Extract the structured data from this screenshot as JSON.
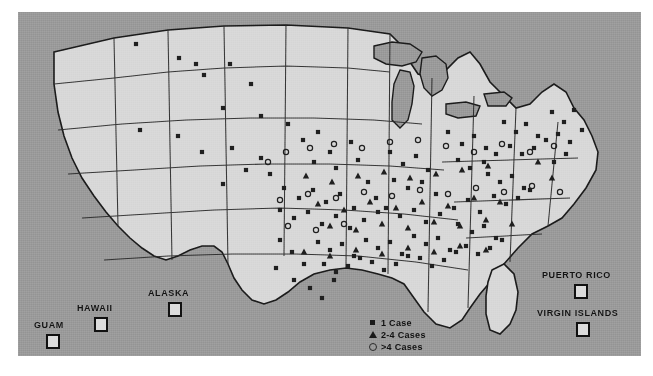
{
  "figure": {
    "background_color": "#ffffff"
  },
  "map": {
    "ocean_color": "#9a9a9a",
    "land_color": "#d8d8d8",
    "border_color": "#1b1b1b",
    "dot_color": "#1f1f1f",
    "frame": {
      "x": 18,
      "y": 12,
      "width": 623,
      "height": 344
    }
  },
  "insets": [
    {
      "name": "guam",
      "label": "GUAM",
      "label_x": 16,
      "label_y": 308,
      "box_x": 28,
      "box_y": 322
    },
    {
      "name": "hawaii",
      "label": "HAWAII",
      "label_x": 59,
      "label_y": 291,
      "box_x": 76,
      "box_y": 305
    },
    {
      "name": "alaska",
      "label": "ALASKA",
      "label_x": 130,
      "label_y": 276,
      "box_x": 150,
      "box_y": 290
    },
    {
      "name": "puerto-rico",
      "label": "PUERTO RICO",
      "label_x": 524,
      "label_y": 258,
      "box_x": 556,
      "box_y": 272
    },
    {
      "name": "virgin-islands",
      "label": "VIRGIN ISLANDS",
      "label_x": 519,
      "label_y": 296,
      "box_x": 558,
      "box_y": 310
    }
  ],
  "legend": {
    "title": "",
    "items": [
      {
        "marker": "square-icon",
        "label": "1 Case"
      },
      {
        "marker": "triangle-icon",
        "label": "2-4 Cases"
      },
      {
        "marker": "circle-icon",
        "label": ">4 Cases"
      }
    ]
  },
  "chart_data": {
    "type": "scatter",
    "xlabel": "",
    "ylabel": "",
    "projection": "US albers-like outline (pixel coordinates within map frame)",
    "grid": false,
    "legend_position": "bottom-center",
    "categories": [
      "1 Case",
      "2-4 Cases",
      ">4 Cases"
    ],
    "marker_shapes": {
      "1 Case": "square",
      "2-4 Cases": "triangle",
      ">4 Cases": "circle"
    },
    "series": [
      {
        "name": "1 Case",
        "symbol": "square",
        "count": 128,
        "points": [
          [
            118,
            32
          ],
          [
            161,
            46
          ],
          [
            178,
            52
          ],
          [
            186,
            63
          ],
          [
            212,
            52
          ],
          [
            233,
            72
          ],
          [
            205,
            96
          ],
          [
            243,
            104
          ],
          [
            122,
            118
          ],
          [
            160,
            124
          ],
          [
            184,
            140
          ],
          [
            214,
            136
          ],
          [
            243,
            146
          ],
          [
            228,
            158
          ],
          [
            252,
            162
          ],
          [
            205,
            172
          ],
          [
            270,
            112
          ],
          [
            285,
            128
          ],
          [
            300,
            120
          ],
          [
            312,
            140
          ],
          [
            296,
            150
          ],
          [
            318,
            156
          ],
          [
            333,
            130
          ],
          [
            340,
            148
          ],
          [
            266,
            176
          ],
          [
            281,
            186
          ],
          [
            295,
            178
          ],
          [
            308,
            190
          ],
          [
            322,
            182
          ],
          [
            336,
            196
          ],
          [
            350,
            170
          ],
          [
            358,
            186
          ],
          [
            262,
            198
          ],
          [
            276,
            206
          ],
          [
            290,
            200
          ],
          [
            304,
            212
          ],
          [
            318,
            204
          ],
          [
            332,
            216
          ],
          [
            346,
            208
          ],
          [
            360,
            200
          ],
          [
            372,
            140
          ],
          [
            385,
            152
          ],
          [
            398,
            144
          ],
          [
            410,
            158
          ],
          [
            376,
            168
          ],
          [
            390,
            176
          ],
          [
            404,
            170
          ],
          [
            418,
            182
          ],
          [
            368,
            196
          ],
          [
            382,
            204
          ],
          [
            396,
            198
          ],
          [
            408,
            210
          ],
          [
            422,
            202
          ],
          [
            436,
            196
          ],
          [
            450,
            188
          ],
          [
            462,
            200
          ],
          [
            430,
            120
          ],
          [
            444,
            132
          ],
          [
            456,
            124
          ],
          [
            468,
            136
          ],
          [
            440,
            148
          ],
          [
            452,
            156
          ],
          [
            466,
            150
          ],
          [
            478,
            142
          ],
          [
            486,
            110
          ],
          [
            498,
            120
          ],
          [
            508,
            112
          ],
          [
            520,
            124
          ],
          [
            492,
            134
          ],
          [
            504,
            142
          ],
          [
            516,
            136
          ],
          [
            528,
            128
          ],
          [
            534,
            100
          ],
          [
            546,
            110
          ],
          [
            556,
            98
          ],
          [
            540,
            122
          ],
          [
            552,
            130
          ],
          [
            564,
            118
          ],
          [
            548,
            142
          ],
          [
            536,
            150
          ],
          [
            470,
            162
          ],
          [
            482,
            170
          ],
          [
            494,
            164
          ],
          [
            506,
            176
          ],
          [
            476,
            184
          ],
          [
            488,
            192
          ],
          [
            500,
            186
          ],
          [
            512,
            178
          ],
          [
            440,
            212
          ],
          [
            454,
            220
          ],
          [
            466,
            214
          ],
          [
            478,
            226
          ],
          [
            448,
            234
          ],
          [
            460,
            242
          ],
          [
            472,
            236
          ],
          [
            484,
            228
          ],
          [
            396,
            224
          ],
          [
            408,
            232
          ],
          [
            420,
            226
          ],
          [
            432,
            238
          ],
          [
            402,
            246
          ],
          [
            414,
            254
          ],
          [
            426,
            248
          ],
          [
            438,
            240
          ],
          [
            348,
            228
          ],
          [
            360,
            236
          ],
          [
            372,
            230
          ],
          [
            384,
            242
          ],
          [
            354,
            250
          ],
          [
            366,
            258
          ],
          [
            378,
            252
          ],
          [
            390,
            244
          ],
          [
            300,
            230
          ],
          [
            312,
            238
          ],
          [
            324,
            232
          ],
          [
            336,
            244
          ],
          [
            306,
            252
          ],
          [
            318,
            260
          ],
          [
            330,
            254
          ],
          [
            342,
            246
          ],
          [
            262,
            228
          ],
          [
            274,
            240
          ],
          [
            286,
            252
          ],
          [
            258,
            256
          ],
          [
            276,
            268
          ],
          [
            292,
            276
          ],
          [
            304,
            286
          ],
          [
            316,
            268
          ]
        ]
      },
      {
        "name": "2-4 Cases",
        "symbol": "triangle",
        "count": 34,
        "points": [
          [
            288,
            164
          ],
          [
            314,
            170
          ],
          [
            340,
            164
          ],
          [
            366,
            160
          ],
          [
            392,
            166
          ],
          [
            418,
            162
          ],
          [
            444,
            158
          ],
          [
            470,
            154
          ],
          [
            300,
            192
          ],
          [
            326,
            198
          ],
          [
            352,
            190
          ],
          [
            378,
            196
          ],
          [
            404,
            190
          ],
          [
            430,
            194
          ],
          [
            456,
            186
          ],
          [
            482,
            190
          ],
          [
            312,
            214
          ],
          [
            338,
            218
          ],
          [
            364,
            212
          ],
          [
            390,
            216
          ],
          [
            416,
            210
          ],
          [
            442,
            214
          ],
          [
            468,
            208
          ],
          [
            494,
            212
          ],
          [
            286,
            240
          ],
          [
            312,
            244
          ],
          [
            338,
            238
          ],
          [
            364,
            242
          ],
          [
            390,
            236
          ],
          [
            416,
            240
          ],
          [
            442,
            234
          ],
          [
            468,
            238
          ],
          [
            520,
            150
          ],
          [
            534,
            166
          ]
        ]
      },
      {
        "name": ">4 Cases",
        "symbol": "circle",
        "count": 26,
        "points": [
          [
            250,
            150
          ],
          [
            268,
            140
          ],
          [
            292,
            136
          ],
          [
            316,
            132
          ],
          [
            344,
            136
          ],
          [
            372,
            130
          ],
          [
            400,
            128
          ],
          [
            428,
            134
          ],
          [
            456,
            140
          ],
          [
            484,
            132
          ],
          [
            512,
            140
          ],
          [
            536,
            134
          ],
          [
            262,
            188
          ],
          [
            290,
            182
          ],
          [
            318,
            186
          ],
          [
            346,
            180
          ],
          [
            374,
            184
          ],
          [
            402,
            178
          ],
          [
            430,
            182
          ],
          [
            458,
            176
          ],
          [
            486,
            180
          ],
          [
            514,
            174
          ],
          [
            542,
            180
          ],
          [
            270,
            214
          ],
          [
            298,
            218
          ],
          [
            326,
            212
          ]
        ]
      }
    ]
  }
}
